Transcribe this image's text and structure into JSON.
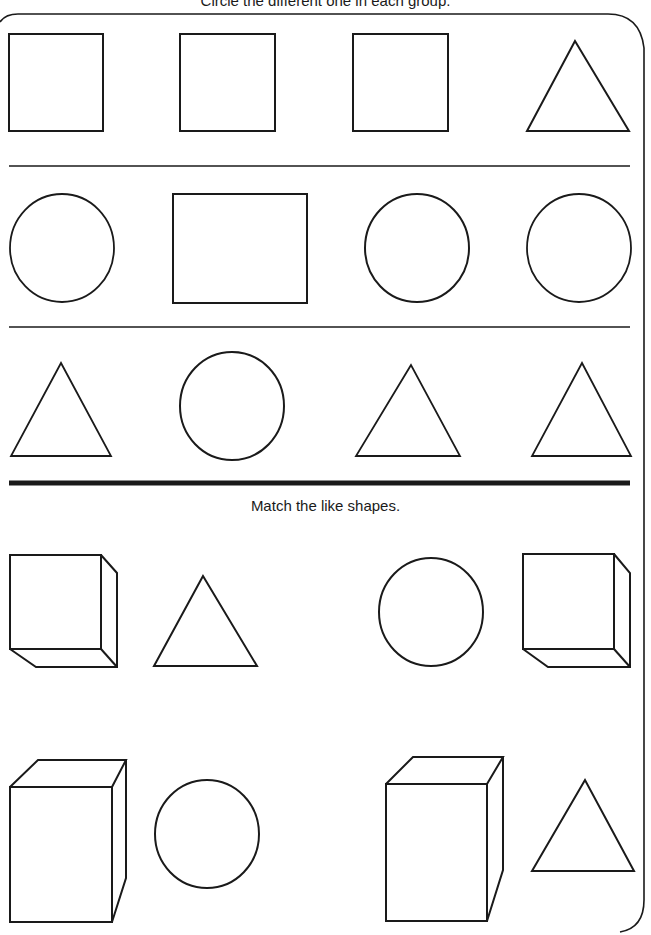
{
  "section1": {
    "instruction": "Circle the different one in each group.",
    "groups": [
      {
        "shapes": [
          "square",
          "square",
          "square",
          "triangle"
        ]
      },
      {
        "shapes": [
          "circle",
          "square",
          "circle",
          "circle"
        ]
      },
      {
        "shapes": [
          "triangle",
          "circle",
          "triangle",
          "triangle"
        ]
      }
    ]
  },
  "section2": {
    "instruction": "Match the like shapes.",
    "rows": [
      {
        "shapes": [
          "cube",
          "triangle",
          "circle",
          "cube"
        ]
      },
      {
        "shapes": [
          "box",
          "circle",
          "box",
          "triangle"
        ]
      }
    ]
  },
  "colors": {
    "ink": "#1a1a1a",
    "paper": "#ffffff"
  }
}
